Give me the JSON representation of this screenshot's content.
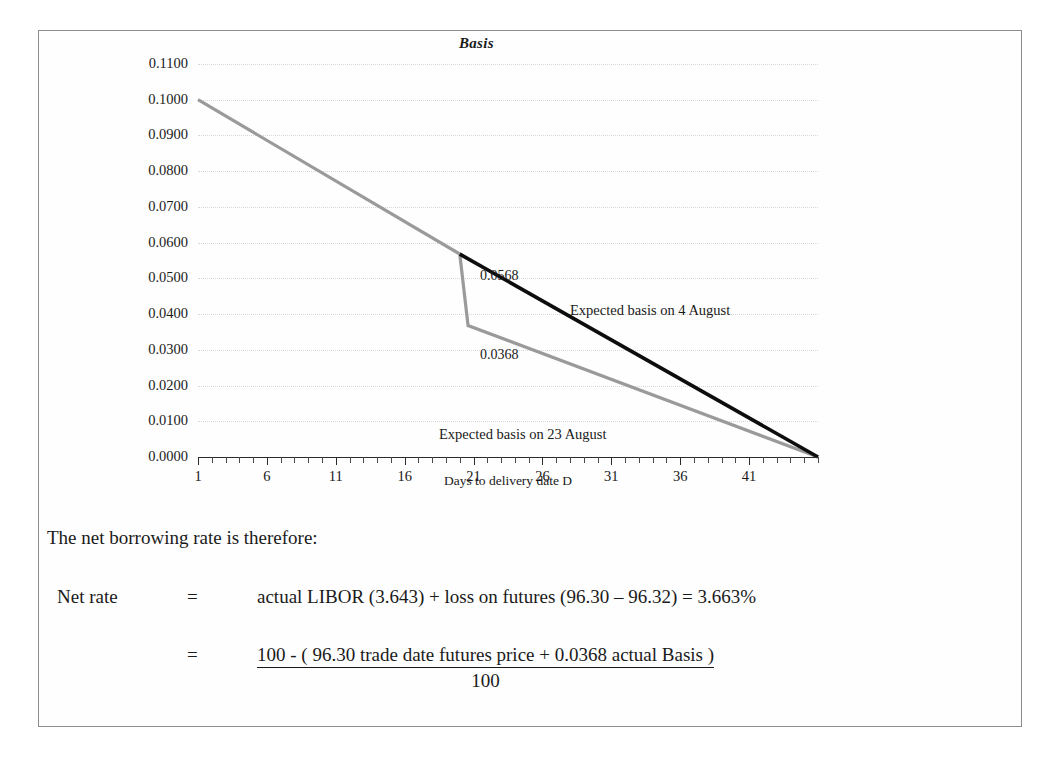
{
  "document": {
    "frame_border_color": "#8d8d8d",
    "background": "#ffffff"
  },
  "chart_data": {
    "type": "line",
    "title": "Basis",
    "xlabel": "Days to delivery date D",
    "ylabel": "",
    "xlim": [
      1,
      46
    ],
    "ylim": [
      0.0,
      0.11
    ],
    "grid": true,
    "legend_position": "inline-annotations",
    "x_tick_labels": [
      "1",
      "6",
      "11",
      "16",
      "21",
      "26",
      "31",
      "36",
      "41"
    ],
    "x_tick_values": [
      1,
      6,
      11,
      16,
      21,
      26,
      31,
      36,
      41
    ],
    "y_tick_labels": [
      "0.1100",
      "0.1000",
      "0.0900",
      "0.0800",
      "0.0700",
      "0.0600",
      "0.0500",
      "0.0400",
      "0.0300",
      "0.0200",
      "0.0100",
      "0.0000"
    ],
    "y_tick_values": [
      0.11,
      0.1,
      0.09,
      0.08,
      0.07,
      0.06,
      0.05,
      0.04,
      0.03,
      0.02,
      0.01,
      0.0
    ],
    "series": [
      {
        "name": "Expected basis on 23 August",
        "color": "#9a9a9a",
        "x": [
          1,
          20,
          20.6,
          46
        ],
        "values": [
          0.1,
          0.0568,
          0.0368,
          0.0
        ]
      },
      {
        "name": "Expected basis on 4 August",
        "color": "#0d0d0d",
        "x": [
          20,
          46
        ],
        "values": [
          0.0568,
          0.0
        ]
      }
    ],
    "annotations": [
      {
        "text": "0.0568",
        "x": 21.2,
        "y": 0.0568
      },
      {
        "text": "0.0368",
        "x": 21.2,
        "y": 0.0368
      },
      {
        "text": "Expected basis on 4 August",
        "x": 26,
        "y": 0.0455
      },
      {
        "text": "Expected basis on 23 August",
        "x": 20,
        "y": 0.0125
      }
    ]
  },
  "chart": {
    "title": "Basis",
    "x_axis_title": "Days to delivery date D",
    "y_tick_labels": [
      "0.1100",
      "0.1000",
      "0.0900",
      "0.0800",
      "0.0700",
      "0.0600",
      "0.0500",
      "0.0400",
      "0.0300",
      "0.0200",
      "0.0100",
      "0.0000"
    ],
    "x_tick_labels": [
      "1",
      "6",
      "11",
      "16",
      "21",
      "26",
      "31",
      "36",
      "41"
    ],
    "point_label_upper": "0.0568",
    "point_label_lower": "0.0368",
    "series_label_black": "Expected basis on 4 August",
    "series_label_gray": "Expected basis on 23 August",
    "color_black_series": "#0d0d0d",
    "color_gray_series": "#9a9a9a"
  },
  "body": {
    "intro": "The net borrowing rate is therefore:",
    "net_rate_label": "Net rate",
    "equals_sign_1": "=",
    "net_rate_expression": "actual LIBOR (3.643) + loss on futures (96.30 – 96.32) = 3.663%",
    "equals_sign_2": "=",
    "fraction_numerator": "100  - ( 96.30 trade date futures price +  0.0368 actual Basis )",
    "fraction_denominator": "100"
  }
}
